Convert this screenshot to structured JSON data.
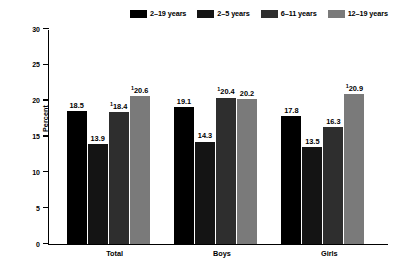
{
  "chart_data": {
    "type": "bar",
    "title": "",
    "xlabel": "",
    "ylabel": "Percent",
    "ylim": [
      0,
      30
    ],
    "yticks": [
      0,
      5,
      10,
      15,
      20,
      25,
      30
    ],
    "grid": false,
    "legend_position": "top",
    "categories": [
      "Total",
      "Boys",
      "Girls"
    ],
    "series": [
      {
        "name": "2–19 years",
        "color": "#000000",
        "values": [
          18.5,
          19.1,
          17.8
        ],
        "labels": [
          "18.5",
          "19.1",
          "17.8"
        ],
        "footnote_marks": [
          "",
          "",
          ""
        ]
      },
      {
        "name": "2–5 years",
        "color": "#141414",
        "values": [
          13.9,
          14.3,
          13.5
        ],
        "labels": [
          "13.9",
          "14.3",
          "13.5"
        ],
        "footnote_marks": [
          "",
          "",
          ""
        ]
      },
      {
        "name": "6–11 years",
        "color": "#2e2e2e",
        "values": [
          18.4,
          20.4,
          16.3
        ],
        "labels": [
          "18.4",
          "20.4",
          "16.3"
        ],
        "footnote_marks": [
          "1",
          "1",
          ""
        ]
      },
      {
        "name": "12–19 years",
        "color": "#7a7a7a",
        "values": [
          20.6,
          20.2,
          20.9
        ],
        "labels": [
          "20.6",
          "20.2",
          "20.9"
        ],
        "footnote_marks": [
          "1",
          "",
          "1"
        ]
      }
    ]
  }
}
